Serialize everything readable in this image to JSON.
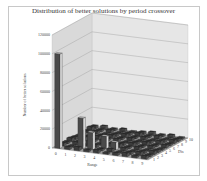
{
  "chart_data": {
    "type": "bar3d",
    "title": "Distribution of better solutions by period crossover",
    "xlabel": "Range",
    "ylabel": "Number of better solutions",
    "zlabel": "Dis",
    "x_categories": [
      "0",
      "1",
      "2",
      "3",
      "4",
      "5",
      "6",
      "7",
      "8",
      "9"
    ],
    "z_categories": [
      "1",
      "2",
      "3",
      "4",
      "5",
      "6",
      "7",
      "8",
      "9",
      "10"
    ],
    "y_ticks": [
      0,
      20000,
      40000,
      60000,
      80000,
      100000,
      120000
    ],
    "y_tick_labels": [
      "0",
      "20000",
      "40000",
      "60000",
      "80000",
      "100000",
      "120000"
    ],
    "ylim": [
      0,
      120000
    ],
    "grid": true,
    "notable_bars": [
      {
        "range": "0",
        "dis": "1",
        "value": 100000
      },
      {
        "range": "2",
        "dis": "2",
        "value": 32000
      },
      {
        "range": "3",
        "dis": "2",
        "value": 18000
      },
      {
        "range": "4",
        "dis": "3",
        "value": 13000
      },
      {
        "range": "5",
        "dis": "3",
        "value": 8000
      }
    ],
    "other_bars_value_range": [
      0,
      4000
    ]
  },
  "labels": {
    "title": "Distribution of better solutions by period crossover",
    "xlabel": "Range",
    "ylabel": "Number of better solutions",
    "zlabel": "Dis"
  }
}
